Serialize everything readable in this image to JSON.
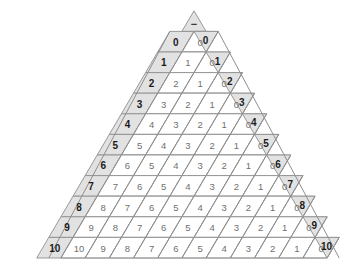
{
  "figure": {
    "kind": "subtraction-triangle-table",
    "operator_symbol": "−",
    "max_value": 10,
    "row_count": 11
  },
  "colors": {
    "shade_fill": "#e2e2e2",
    "cell_fill": "#ffffff",
    "line": "#8f8f8f",
    "line_strong": "#9d9d9d",
    "cell_text": "#6f6f6f",
    "edge_text": "#1b1b1b",
    "background": "#ffffff"
  },
  "left_labels": [
    "0",
    "1",
    "2",
    "3",
    "4",
    "5",
    "6",
    "7",
    "8",
    "9",
    "10"
  ],
  "right_labels": [
    "0",
    "1",
    "2",
    "3",
    "4",
    "5",
    "6",
    "7",
    "8",
    "9",
    "10"
  ],
  "chart_data": {
    "type": "table",
    "title": "",
    "xlabel": "",
    "ylabel": "",
    "operator": "−",
    "row_headers": [
      "0",
      "1",
      "2",
      "3",
      "4",
      "5",
      "6",
      "7",
      "8",
      "9",
      "10"
    ],
    "col_headers": [
      "0",
      "1",
      "2",
      "3",
      "4",
      "5",
      "6",
      "7",
      "8",
      "9",
      "10"
    ],
    "rows": [
      [
        "0"
      ],
      [
        "1",
        "0"
      ],
      [
        "2",
        "1",
        "0"
      ],
      [
        "3",
        "2",
        "1",
        "0"
      ],
      [
        "4",
        "3",
        "2",
        "1",
        "0"
      ],
      [
        "5",
        "4",
        "3",
        "2",
        "1",
        "0"
      ],
      [
        "6",
        "5",
        "4",
        "3",
        "2",
        "1",
        "0"
      ],
      [
        "7",
        "6",
        "5",
        "4",
        "3",
        "2",
        "1",
        "0"
      ],
      [
        "8",
        "7",
        "6",
        "5",
        "4",
        "3",
        "2",
        "1",
        "0"
      ],
      [
        "9",
        "8",
        "7",
        "6",
        "5",
        "4",
        "3",
        "2",
        "1",
        "0"
      ],
      [
        "10",
        "9",
        "8",
        "7",
        "6",
        "5",
        "4",
        "3",
        "2",
        "1",
        "0"
      ]
    ]
  }
}
